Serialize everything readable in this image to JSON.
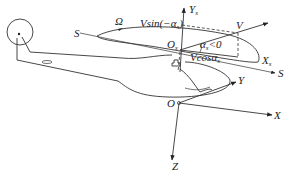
{
  "diagram": {
    "type": "helicopter-rotor-coordinate-system",
    "labels": {
      "omega": "Ω",
      "s_left": "S",
      "s_right": "S",
      "v_sin": "Vsin(−α",
      "v_sin_sub": "s",
      "v_sin_close": ")",
      "v": "V",
      "ys": "Y",
      "ys_sub": "s",
      "os": "O",
      "os_sub": "s",
      "alpha": "α",
      "alpha_sub": "s",
      "alpha_cond": "<0",
      "v_cos": "Vcosα",
      "v_cos_sub": "s",
      "xs": "X",
      "xs_sub": "s",
      "o": "O",
      "y": "Y",
      "x": "X",
      "z": "Z"
    },
    "caption": ""
  }
}
